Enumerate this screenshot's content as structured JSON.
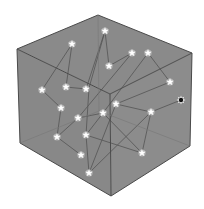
{
  "figure": {
    "colors": {
      "background": "#ffffff",
      "cube_face": "#8a8a8a",
      "cube_edge": "#4a4a4a",
      "path_line": "#5a5a5a",
      "star": "#ffffff",
      "special_node": "#111111"
    }
  },
  "cube": {
    "vertices": {
      "top": [
        98,
        15
      ],
      "top_left": [
        17,
        49
      ],
      "top_right": [
        192,
        53
      ],
      "center": [
        110,
        94
      ],
      "bottom_left": [
        20,
        143
      ],
      "bottom": [
        111,
        196
      ],
      "bottom_right": [
        190,
        146
      ]
    }
  },
  "stars": [
    [
      105,
      31
    ],
    [
      72,
      44
    ],
    [
      132,
      53
    ],
    [
      148,
      53
    ],
    [
      109,
      66
    ],
    [
      170,
      82
    ],
    [
      42,
      90
    ],
    [
      66,
      87
    ],
    [
      86,
      89
    ],
    [
      61,
      108
    ],
    [
      116,
      104
    ],
    [
      151,
      112
    ],
    [
      78,
      118
    ],
    [
      103,
      113
    ],
    [
      57,
      137
    ],
    [
      86,
      135
    ],
    [
      81,
      155
    ],
    [
      142,
      153
    ],
    [
      89,
      173
    ]
  ],
  "special_node": [
    181,
    100
  ],
  "paths": [
    [
      [
        72,
        44
      ],
      [
        66,
        87
      ],
      [
        86,
        89
      ],
      [
        105,
        31
      ],
      [
        109,
        66
      ],
      [
        132,
        53
      ]
    ],
    [
      [
        148,
        53
      ],
      [
        170,
        82
      ],
      [
        116,
        104
      ],
      [
        151,
        112
      ],
      [
        142,
        153
      ],
      [
        103,
        113
      ],
      [
        78,
        118
      ],
      [
        57,
        137
      ],
      [
        81,
        155
      ]
    ],
    [
      [
        72,
        44
      ],
      [
        42,
        90
      ],
      [
        61,
        108
      ],
      [
        57,
        137
      ]
    ],
    [
      [
        105,
        31
      ],
      [
        89,
        88
      ],
      [
        86,
        135
      ],
      [
        89,
        173
      ],
      [
        116,
        104
      ]
    ],
    [
      [
        148,
        53
      ],
      [
        103,
        113
      ],
      [
        86,
        135
      ],
      [
        142,
        153
      ]
    ],
    [
      [
        181,
        100
      ],
      [
        151,
        112
      ],
      [
        89,
        173
      ]
    ],
    [
      [
        132,
        53
      ],
      [
        78,
        118
      ]
    ]
  ]
}
